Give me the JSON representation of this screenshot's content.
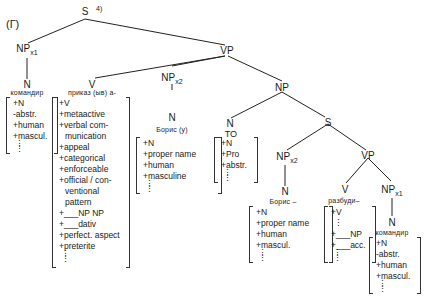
{
  "figure_label": "(Г)",
  "footnote_marker": "4)",
  "nodes": {
    "S_root": "S",
    "NP_x1_subject": {
      "label": "NP",
      "sub": "x1"
    },
    "N_subject": "N",
    "VP_main": "VP",
    "V_main": "V",
    "NP_x2_object": {
      "label": "NP",
      "sub": "x2"
    },
    "N_object": "N",
    "NP_complement": "NP",
    "N_to": "N",
    "S_embedded": "S",
    "NP_x2_embedded": {
      "label": "NP",
      "sub": "x2"
    },
    "N_embedded_subject": "N",
    "VP_embedded": "VP",
    "V_embedded": "V",
    "NP_x1_embedded": {
      "label": "NP",
      "sub": "x1"
    },
    "N_embedded_object": "N"
  },
  "lexical_items": {
    "komandir_1": "командир",
    "prikaz": "приказ (ыв) а-",
    "boris_y": "Борис (у)",
    "to": "ТО",
    "boris_dash": "Борис –",
    "razbudi": "разбуди–",
    "komandir_2": "командир"
  },
  "feature_matrices": {
    "komandir_1": [
      "+N",
      "-abstr.",
      "+human",
      "+mascul."
    ],
    "prikaz": [
      "+V",
      "+metaactive",
      "+verbal com-",
      "munication",
      "+appeal",
      "+categorical",
      "+enforceable",
      "+official / con-",
      "ventional",
      "pattern",
      "+___NP NP",
      "+___dativ",
      "+perfect. aspect",
      "+preterite"
    ],
    "boris_y": [
      "+N",
      "+proper name",
      "+human",
      "+masculine"
    ],
    "to": [
      "+N",
      "+Pro",
      "+abstr."
    ],
    "boris_dash": [
      "+N",
      "+proper name",
      "+human",
      "+mascul."
    ],
    "razbudi": [
      "+V",
      "⋮",
      "+___NP",
      "+___acc."
    ],
    "komandir_2": [
      "+N",
      "-abstr.",
      "+human",
      "+mascul."
    ]
  }
}
